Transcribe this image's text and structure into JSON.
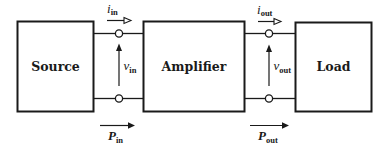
{
  "diagram": {
    "blocks": [
      {
        "id": "source",
        "label": "Source"
      },
      {
        "id": "amplifier",
        "label": "Amplifier"
      },
      {
        "id": "load",
        "label": "Load"
      }
    ],
    "input_port": {
      "current": {
        "symbol": "i",
        "subscript": "in"
      },
      "voltage": {
        "symbol": "v",
        "subscript": "in"
      },
      "power": {
        "symbol": "P",
        "subscript": "in"
      }
    },
    "output_port": {
      "current": {
        "symbol": "i",
        "subscript": "out"
      },
      "voltage": {
        "symbol": "v",
        "subscript": "out"
      },
      "power": {
        "symbol": "P",
        "subscript": "out"
      }
    },
    "colors": {
      "line": "#1a1a1a",
      "background": "#ffffff"
    }
  }
}
